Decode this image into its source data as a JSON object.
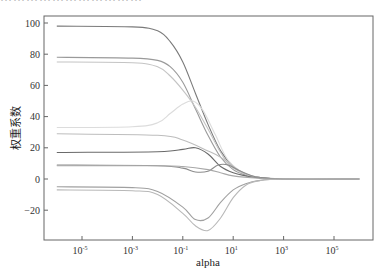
{
  "header": {
    "cut_off_text": "……………………………"
  },
  "chart_data": {
    "type": "line",
    "title": "",
    "xlabel": "alpha",
    "ylabel": "权重系数",
    "xscale": "log",
    "xlim_log10": [
      -6.95,
      6.6
    ],
    "ylim": [
      -38,
      104
    ],
    "x_ticks": [
      {
        "exp": -5,
        "label": "10",
        "sup": "-5"
      },
      {
        "exp": -3,
        "label": "10",
        "sup": "-3"
      },
      {
        "exp": -1,
        "label": "10",
        "sup": "-1"
      },
      {
        "exp": 1,
        "label": "10",
        "sup": "1"
      },
      {
        "exp": 3,
        "label": "10",
        "sup": "3"
      },
      {
        "exp": 5,
        "label": "10",
        "sup": "5"
      }
    ],
    "y_ticks": [
      100,
      80,
      60,
      40,
      20,
      0,
      -20
    ],
    "grid": false,
    "legend": null,
    "series": [
      {
        "name": "coef1",
        "color": "#7a7a7a",
        "points": [
          [
            -6,
            98
          ],
          [
            -3,
            97.5
          ],
          [
            -2,
            95
          ],
          [
            -1.5,
            88
          ],
          [
            -1,
            75
          ],
          [
            -0.5,
            55
          ],
          [
            0,
            35
          ],
          [
            0.5,
            18
          ],
          [
            1,
            8
          ],
          [
            1.5,
            3
          ],
          [
            2,
            1
          ],
          [
            3,
            0
          ],
          [
            6,
            0
          ]
        ]
      },
      {
        "name": "coef2",
        "color": "#9a9a9a",
        "points": [
          [
            -6,
            78
          ],
          [
            -3,
            77.5
          ],
          [
            -2,
            76
          ],
          [
            -1.5,
            72
          ],
          [
            -1,
            62
          ],
          [
            -0.5,
            45
          ],
          [
            0,
            28
          ],
          [
            0.5,
            14
          ],
          [
            1,
            6
          ],
          [
            1.5,
            2.5
          ],
          [
            2,
            1
          ],
          [
            3,
            0
          ],
          [
            6,
            0
          ]
        ]
      },
      {
        "name": "coef3",
        "color": "#c4c4c4",
        "points": [
          [
            -6,
            75
          ],
          [
            -3,
            74.5
          ],
          [
            -2,
            72
          ],
          [
            -1.5,
            66
          ],
          [
            -1,
            57
          ],
          [
            -0.5,
            46
          ],
          [
            0,
            32
          ],
          [
            0.5,
            17
          ],
          [
            1,
            7
          ],
          [
            2,
            1
          ],
          [
            3,
            0
          ],
          [
            6,
            0
          ]
        ]
      },
      {
        "name": "coef4",
        "color": "#dcdcdc",
        "points": [
          [
            -6,
            33
          ],
          [
            -3,
            33.5
          ],
          [
            -2,
            36
          ],
          [
            -1.5,
            42
          ],
          [
            -1,
            48
          ],
          [
            -0.6,
            50
          ],
          [
            -0.2,
            44
          ],
          [
            0.3,
            28
          ],
          [
            0.8,
            12
          ],
          [
            1.5,
            3
          ],
          [
            2,
            1
          ],
          [
            3,
            0
          ],
          [
            6,
            0
          ]
        ]
      },
      {
        "name": "coef5",
        "color": "#bdbdbd",
        "points": [
          [
            -6,
            29
          ],
          [
            -2,
            28
          ],
          [
            -1,
            25
          ],
          [
            0,
            18
          ],
          [
            0.5,
            14
          ],
          [
            1,
            8
          ],
          [
            1.5,
            3
          ],
          [
            2,
            1
          ],
          [
            3,
            0
          ],
          [
            6,
            0
          ]
        ]
      },
      {
        "name": "coef6",
        "color": "#6a6a6a",
        "points": [
          [
            -6,
            17
          ],
          [
            -2,
            17.5
          ],
          [
            -1,
            19
          ],
          [
            -0.5,
            20
          ],
          [
            0,
            16
          ],
          [
            0.5,
            8
          ],
          [
            1,
            4
          ],
          [
            1.5,
            2
          ],
          [
            2,
            0.8
          ],
          [
            3,
            0
          ],
          [
            6,
            0
          ]
        ]
      },
      {
        "name": "coef7",
        "color": "#8c8c8c",
        "points": [
          [
            -6,
            9
          ],
          [
            -2,
            8.5
          ],
          [
            -1,
            7
          ],
          [
            -0.5,
            4.5
          ],
          [
            0,
            5
          ],
          [
            0.4,
            9
          ],
          [
            0.8,
            9
          ],
          [
            1.3,
            5
          ],
          [
            2,
            1
          ],
          [
            3,
            0
          ],
          [
            6,
            0
          ]
        ]
      },
      {
        "name": "coef8",
        "color": "#a8a8a8",
        "points": [
          [
            -6,
            8.5
          ],
          [
            -2,
            8.5
          ],
          [
            -1,
            8
          ],
          [
            0,
            6
          ],
          [
            0.5,
            4
          ],
          [
            1,
            2
          ],
          [
            2,
            0.5
          ],
          [
            3,
            0
          ],
          [
            6,
            0
          ]
        ]
      },
      {
        "name": "coef9",
        "color": "#a0a0a0",
        "points": [
          [
            -6,
            -5
          ],
          [
            -3,
            -5.5
          ],
          [
            -2,
            -8
          ],
          [
            -1,
            -18
          ],
          [
            -0.5,
            -26
          ],
          [
            0,
            -25
          ],
          [
            0.5,
            -15
          ],
          [
            1,
            -7
          ],
          [
            1.5,
            -3
          ],
          [
            2,
            -1
          ],
          [
            3,
            0
          ],
          [
            6,
            0
          ]
        ]
      },
      {
        "name": "coef10",
        "color": "#b8b8b8",
        "points": [
          [
            -6,
            -7
          ],
          [
            -3,
            -7.5
          ],
          [
            -2,
            -10
          ],
          [
            -1,
            -22
          ],
          [
            -0.5,
            -30
          ],
          [
            0,
            -33
          ],
          [
            0.5,
            -25
          ],
          [
            1,
            -12
          ],
          [
            1.5,
            -4
          ],
          [
            2,
            -1.2
          ],
          [
            3,
            0
          ],
          [
            6,
            0
          ]
        ]
      }
    ]
  }
}
